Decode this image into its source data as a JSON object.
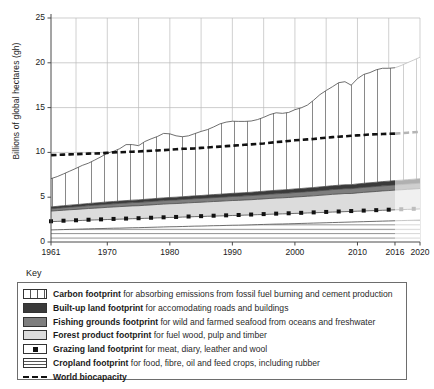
{
  "axes": {
    "ylabel": "Billions of global hectares (gh)",
    "yticks": [
      "0",
      "5",
      "10",
      "15",
      "20",
      "25"
    ],
    "xticks": [
      "1961",
      "1970",
      "1980",
      "1990",
      "2000",
      "2010",
      "2016",
      "2020"
    ]
  },
  "legend": {
    "title": "Key",
    "items": [
      {
        "swatch": "carbon-swatch",
        "name": "Carbon footprint",
        "desc": " for absorbing emissions from fossil fuel burning and cement production"
      },
      {
        "swatch": "builtup-swatch",
        "name": "Built-up land footprint",
        "desc": " for accomodating roads and buildings"
      },
      {
        "swatch": "fishing-swatch",
        "name": "Fishing grounds footprint",
        "desc": " for wild and farmed seafood from oceans and freshwater"
      },
      {
        "swatch": "forest-swatch",
        "name": "Forest product footprint",
        "desc": " for fuel wood, pulp and timber"
      },
      {
        "swatch": "grazing-swatch",
        "name": "Grazing land footprint",
        "desc": " for meat, diary, leather and wool"
      },
      {
        "swatch": "cropland-swatch",
        "name": "Cropland footprint",
        "desc": " for food, fibre, oil and feed crops, including rubber"
      },
      {
        "swatch": "biocapacity-swatch",
        "name": "World biocapacity",
        "desc": ""
      }
    ]
  },
  "chart_data": {
    "type": "area",
    "title": "",
    "xlabel": "",
    "ylabel": "Billions of global hectares (gh)",
    "xlim": [
      1961,
      2020
    ],
    "ylim": [
      0,
      25
    ],
    "grid": true,
    "legend_position": "below",
    "projection_start": 2016,
    "note": "Stacked area chart of global Ecological Footprint components; values in billions of global hectares (gha). Values from 2017 onward are shown faded as projection.",
    "x": [
      1961,
      1962,
      1963,
      1964,
      1965,
      1966,
      1967,
      1968,
      1969,
      1970,
      1971,
      1972,
      1973,
      1974,
      1975,
      1976,
      1977,
      1978,
      1979,
      1980,
      1981,
      1982,
      1983,
      1984,
      1985,
      1986,
      1987,
      1988,
      1989,
      1990,
      1991,
      1992,
      1993,
      1994,
      1995,
      1996,
      1997,
      1998,
      1999,
      2000,
      2001,
      2002,
      2003,
      2004,
      2005,
      2006,
      2007,
      2008,
      2009,
      2010,
      2011,
      2012,
      2013,
      2014,
      2015,
      2016,
      2017,
      2018,
      2019,
      2020
    ],
    "series": [
      {
        "name": "Cropland footprint",
        "fill": "#ffffff",
        "pattern": "horizontal-lines",
        "values": [
          1.35,
          1.37,
          1.39,
          1.41,
          1.43,
          1.45,
          1.47,
          1.49,
          1.5,
          1.52,
          1.54,
          1.55,
          1.57,
          1.59,
          1.6,
          1.62,
          1.64,
          1.66,
          1.68,
          1.7,
          1.71,
          1.73,
          1.75,
          1.77,
          1.78,
          1.8,
          1.82,
          1.83,
          1.85,
          1.87,
          1.88,
          1.9,
          1.92,
          1.94,
          1.96,
          1.98,
          2.0,
          2.01,
          2.03,
          2.05,
          2.07,
          2.09,
          2.11,
          2.13,
          2.15,
          2.17,
          2.19,
          2.21,
          2.23,
          2.25,
          2.27,
          2.29,
          2.31,
          2.33,
          2.35,
          2.37,
          2.39,
          2.41,
          2.43,
          2.45
        ]
      },
      {
        "name": "Grazing land footprint",
        "fill": "#ffffff",
        "pattern": "dotted-marker",
        "values": [
          0.92,
          0.93,
          0.94,
          0.95,
          0.95,
          0.96,
          0.97,
          0.97,
          0.98,
          0.99,
          0.99,
          1.0,
          1.0,
          1.01,
          1.01,
          1.02,
          1.02,
          1.03,
          1.03,
          1.04,
          1.04,
          1.05,
          1.05,
          1.06,
          1.06,
          1.07,
          1.07,
          1.08,
          1.08,
          1.09,
          1.09,
          1.1,
          1.1,
          1.11,
          1.11,
          1.12,
          1.12,
          1.13,
          1.13,
          1.14,
          1.14,
          1.15,
          1.15,
          1.16,
          1.16,
          1.17,
          1.17,
          1.18,
          1.18,
          1.19,
          1.19,
          1.2,
          1.2,
          1.21,
          1.21,
          1.22,
          1.22,
          1.23,
          1.23,
          1.24
        ]
      },
      {
        "name": "Forest product footprint",
        "fill": "#dcdcdc",
        "pattern": "solid",
        "values": [
          1.18,
          1.2,
          1.22,
          1.24,
          1.26,
          1.28,
          1.3,
          1.32,
          1.34,
          1.36,
          1.38,
          1.4,
          1.42,
          1.43,
          1.44,
          1.46,
          1.48,
          1.5,
          1.52,
          1.53,
          1.54,
          1.55,
          1.57,
          1.58,
          1.6,
          1.61,
          1.63,
          1.64,
          1.66,
          1.67,
          1.68,
          1.69,
          1.7,
          1.72,
          1.74,
          1.76,
          1.78,
          1.79,
          1.81,
          1.83,
          1.85,
          1.87,
          1.89,
          1.92,
          1.95,
          1.98,
          2.0,
          2.02,
          2.0,
          2.04,
          2.08,
          2.1,
          2.13,
          2.16,
          2.18,
          2.2,
          2.22,
          2.24,
          2.26,
          2.28
        ]
      },
      {
        "name": "Fishing grounds footprint",
        "fill": "#7e7e7e",
        "pattern": "solid",
        "values": [
          0.26,
          0.27,
          0.28,
          0.29,
          0.3,
          0.31,
          0.32,
          0.33,
          0.34,
          0.35,
          0.35,
          0.36,
          0.36,
          0.37,
          0.37,
          0.38,
          0.38,
          0.39,
          0.39,
          0.4,
          0.4,
          0.41,
          0.41,
          0.42,
          0.42,
          0.43,
          0.43,
          0.44,
          0.44,
          0.45,
          0.45,
          0.46,
          0.46,
          0.47,
          0.47,
          0.48,
          0.48,
          0.49,
          0.49,
          0.5,
          0.5,
          0.51,
          0.51,
          0.52,
          0.52,
          0.53,
          0.53,
          0.54,
          0.54,
          0.55,
          0.55,
          0.56,
          0.56,
          0.57,
          0.57,
          0.58,
          0.58,
          0.59,
          0.59,
          0.6
        ]
      },
      {
        "name": "Built-up land footprint",
        "fill": "#3a3a3a",
        "pattern": "solid",
        "values": [
          0.21,
          0.21,
          0.22,
          0.22,
          0.23,
          0.23,
          0.24,
          0.24,
          0.25,
          0.25,
          0.26,
          0.26,
          0.27,
          0.27,
          0.28,
          0.28,
          0.29,
          0.29,
          0.3,
          0.3,
          0.31,
          0.31,
          0.32,
          0.32,
          0.33,
          0.33,
          0.34,
          0.34,
          0.35,
          0.35,
          0.36,
          0.36,
          0.37,
          0.37,
          0.38,
          0.38,
          0.39,
          0.39,
          0.4,
          0.4,
          0.41,
          0.41,
          0.42,
          0.42,
          0.43,
          0.43,
          0.44,
          0.44,
          0.45,
          0.45,
          0.46,
          0.46,
          0.47,
          0.47,
          0.48,
          0.48,
          0.49,
          0.49,
          0.5,
          0.5
        ]
      },
      {
        "name": "Carbon footprint",
        "fill": "#ffffff",
        "pattern": "vertical-lines",
        "values": [
          3.15,
          3.32,
          3.55,
          3.8,
          4.05,
          4.32,
          4.5,
          4.8,
          5.1,
          5.45,
          5.6,
          5.85,
          6.25,
          6.2,
          6.05,
          6.45,
          6.7,
          6.9,
          7.2,
          7.1,
          6.85,
          6.7,
          6.75,
          6.95,
          7.15,
          7.3,
          7.55,
          7.85,
          8.0,
          8.05,
          8.0,
          7.95,
          7.95,
          8.05,
          8.25,
          8.5,
          8.65,
          8.55,
          8.6,
          8.85,
          9.0,
          9.25,
          9.75,
          10.3,
          10.7,
          11.05,
          11.45,
          11.5,
          11.1,
          11.75,
          12.15,
          12.3,
          12.55,
          12.65,
          12.6,
          12.6,
          12.8,
          13.05,
          13.3,
          13.55
        ]
      }
    ],
    "total_footprint": [
      7.07,
      7.3,
      7.6,
      7.91,
      8.22,
      8.55,
      8.8,
      9.15,
      9.51,
      9.92,
      10.12,
      10.42,
      10.87,
      10.87,
      10.75,
      11.21,
      11.51,
      11.77,
      12.12,
      12.07,
      11.85,
      11.75,
      11.85,
      12.1,
      12.34,
      12.54,
      12.84,
      13.18,
      13.38,
      13.48,
      13.46,
      13.46,
      13.5,
      13.66,
      13.91,
      14.22,
      14.42,
      14.36,
      14.46,
      14.77,
      14.97,
      15.28,
      15.83,
      16.45,
      16.91,
      17.33,
      17.78,
      17.89,
      17.5,
      18.23,
      18.7,
      18.91,
      19.22,
      19.39,
      19.39,
      19.45,
      19.7,
      20.01,
      20.31,
      20.62
    ],
    "biocapacity": {
      "name": "World biocapacity",
      "style": "dashed",
      "color": "#111111",
      "values": [
        9.7,
        9.72,
        9.75,
        9.78,
        9.8,
        9.83,
        9.86,
        9.88,
        9.9,
        9.95,
        10.0,
        10.02,
        10.05,
        10.08,
        10.1,
        10.15,
        10.18,
        10.22,
        10.25,
        10.3,
        10.35,
        10.4,
        10.42,
        10.45,
        10.5,
        10.55,
        10.6,
        10.65,
        10.7,
        10.75,
        10.8,
        10.85,
        10.9,
        10.95,
        11.0,
        11.08,
        11.15,
        11.2,
        11.28,
        11.35,
        11.4,
        11.45,
        11.5,
        11.58,
        11.65,
        11.7,
        11.75,
        11.8,
        11.85,
        11.9,
        11.95,
        12.0,
        12.02,
        12.05,
        12.08,
        12.1,
        12.15,
        12.2,
        12.25,
        12.3
      ]
    }
  }
}
